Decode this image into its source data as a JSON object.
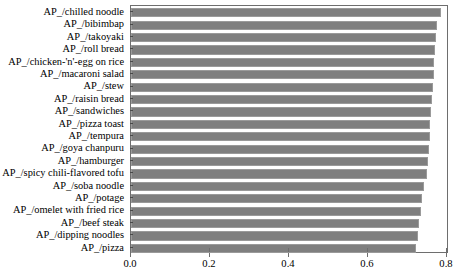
{
  "chart_data": {
    "type": "bar",
    "orientation": "horizontal",
    "title": "",
    "xlabel": "",
    "ylabel": "",
    "xlim": [
      0.0,
      0.8051
    ],
    "grid": false,
    "legend": null,
    "xticks": [
      "0.0",
      "0.2",
      "0.4",
      "0.6",
      "0.8"
    ],
    "xtick_values": [
      0.0,
      0.2,
      0.4,
      0.6,
      0.8
    ],
    "categories": [
      "AP_/chilled noodle",
      "AP_/bibimbap",
      "AP_/takoyaki",
      "AP_/roll bread",
      "AP_/chicken-'n'-egg on rice",
      "AP_/macaroni salad",
      "AP_/stew",
      "AP_/raisin bread",
      "AP_/sandwiches",
      "AP_/pizza toast",
      "AP_/tempura",
      "AP_/goya chanpuru",
      "AP_/hamburger",
      "AP_/spicy chili-flavored tofu",
      "AP_/soba noodle",
      "AP_/potage",
      "AP_/omelet with fried rice",
      "AP_/beef steak",
      "AP_/dipping noodles",
      "AP_/pizza"
    ],
    "values": [
      0.785,
      0.775,
      0.772,
      0.77,
      0.768,
      0.766,
      0.764,
      0.762,
      0.76,
      0.758,
      0.756,
      0.754,
      0.752,
      0.75,
      0.742,
      0.738,
      0.734,
      0.73,
      0.726,
      0.722
    ]
  },
  "colors": {
    "bar_fill": "#7f7f7f",
    "bar_edge": "#9a9a9a",
    "axis": "#6e6e6e",
    "text": "#000000"
  },
  "caption": {
    "text": ""
  }
}
